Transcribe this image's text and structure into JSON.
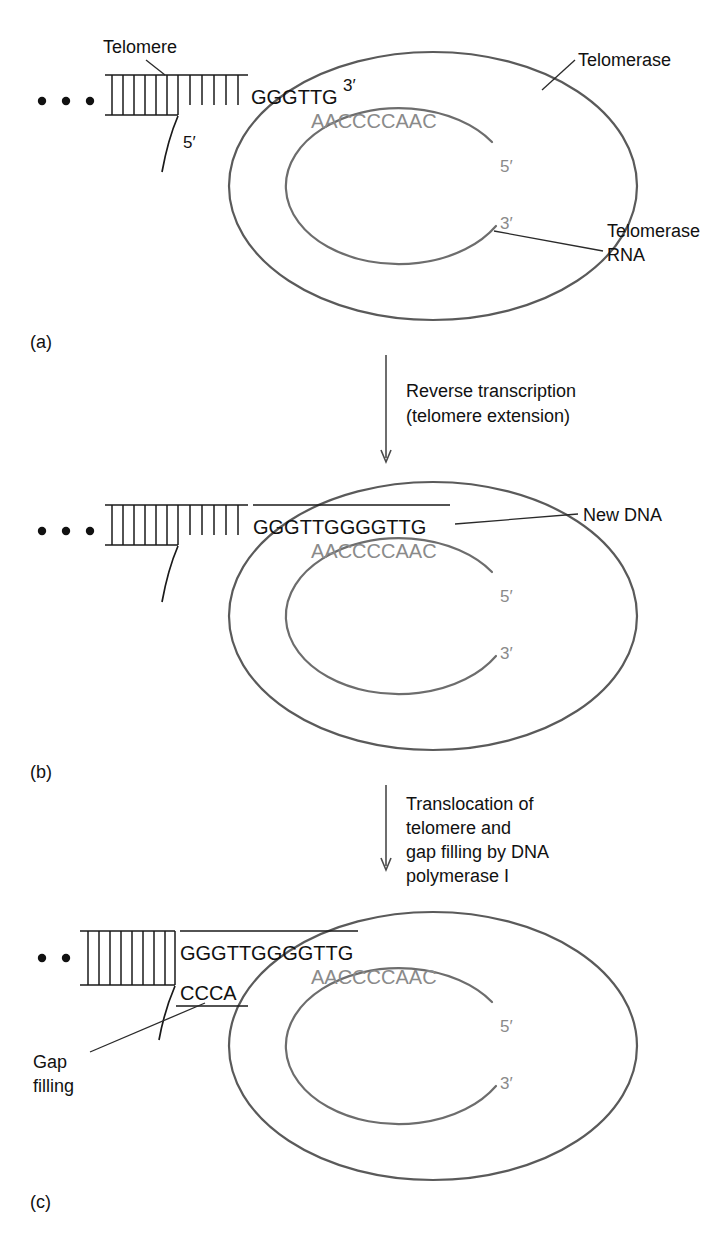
{
  "figure": {
    "colors": {
      "dna_black": "#111111",
      "rna_gray": "#8a8a8a",
      "enzyme_outline": "#5a5a5a",
      "background": "#ffffff"
    }
  },
  "panels": [
    {
      "id": "a",
      "label": "(a)",
      "dna_sequence": "GGGTTG",
      "dna_three_prime": "3′",
      "dna_five_prime": "5′",
      "rna_sequence": "AACCCCAAC",
      "rna_five_prime": "5′",
      "rna_three_prime": "3′",
      "callouts": [
        {
          "name": "telomere",
          "text": "Telomere"
        },
        {
          "name": "telomerase",
          "text": "Telomerase"
        },
        {
          "name": "telomerase-rna",
          "line1": "Telomerase",
          "line2": "RNA"
        }
      ]
    },
    {
      "id": "b",
      "label": "(b)",
      "dna_sequence": "GGGTTGGGGTTG",
      "rna_sequence": "AACCCCAAC",
      "rna_five_prime": "5′",
      "rna_three_prime": "3′",
      "callouts": [
        {
          "name": "new-dna",
          "text": "New DNA"
        }
      ]
    },
    {
      "id": "c",
      "label": "(c)",
      "dna_sequence": "GGGTTGGGGTTG",
      "complement_sequence": "CCCA",
      "rna_sequence": "AACCCCAAC",
      "rna_five_prime": "5′",
      "rna_three_prime": "3′",
      "callouts": [
        {
          "name": "gap-filling",
          "line1": "Gap",
          "line2": "filling"
        }
      ]
    }
  ],
  "steps": [
    {
      "id": "step-ab",
      "line1": "Reverse transcription",
      "line2": "(telomere extension)"
    },
    {
      "id": "step-bc",
      "line1": "Translocation of",
      "line2": "telomere and",
      "line3": "gap filling by DNA",
      "line4": "polymerase I"
    }
  ]
}
